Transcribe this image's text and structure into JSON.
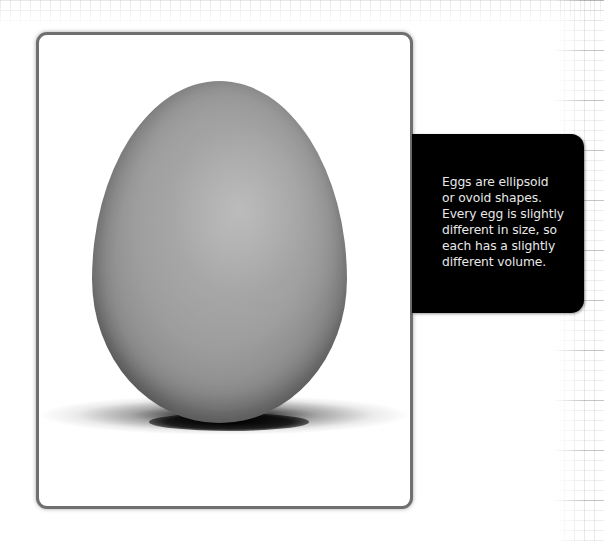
{
  "figure": {
    "photo": {
      "subject": "egg",
      "alt": "A single egg standing upright on a white surface with a soft shadow"
    },
    "caption": {
      "lines": [
        "Eggs are ellipsoid",
        "or ovoid shapes.",
        "Every egg is slightly",
        "different in size, so",
        "each has a slightly",
        "different volume."
      ],
      "text": "Eggs are ellipsoid or ovoid shapes. Every egg is slightly different in size, so each has a slightly different volume."
    },
    "colors": {
      "frame_border": "#6f6f6f",
      "caption_background": "#000000",
      "caption_text": "#e8e8e8",
      "egg_gray": "#a0a0a0",
      "page_background": "#ffffff"
    }
  }
}
